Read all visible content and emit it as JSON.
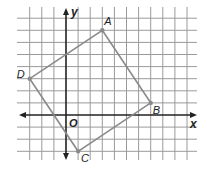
{
  "figure": {
    "type": "coordinate-grid",
    "grid": {
      "x_min": -3,
      "x_max": 10,
      "y_min": -3,
      "y_max": 8,
      "origin_px": [
        66,
        115
      ],
      "unit_px": 12.1,
      "grid_top_px": 7,
      "grid_bottom_px": 160,
      "grid_left_px": 17,
      "grid_right_px": 197,
      "line_color": "#9a9a9a",
      "axis_color": "#222222"
    },
    "axes": {
      "x_label": "x",
      "y_label": "y",
      "origin_label": "O"
    },
    "polygon": {
      "stroke_color": "#8a8a8a",
      "vertices": [
        {
          "label": "A",
          "x": 3,
          "y": 7,
          "label_dx": 2,
          "label_dy": -5
        },
        {
          "label": "B",
          "x": 7,
          "y": 1,
          "label_dx": 2,
          "label_dy": 11
        },
        {
          "label": "C",
          "x": 1,
          "y": -3,
          "label_dx": 3,
          "label_dy": 11
        },
        {
          "label": "D",
          "x": -3,
          "y": 3,
          "label_dx": -13,
          "label_dy": -1
        }
      ]
    }
  }
}
